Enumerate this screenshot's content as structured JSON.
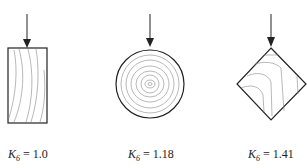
{
  "figures": [
    {
      "shape": "rectangle",
      "symbol": "K",
      "subscript": "6",
      "equals": "=",
      "value": "1.0"
    },
    {
      "shape": "circle",
      "symbol": "K",
      "subscript": "6",
      "equals": "=",
      "value": "1.18"
    },
    {
      "shape": "diamond",
      "symbol": "K",
      "subscript": "6",
      "equals": "=",
      "value": "1.41"
    }
  ],
  "colors": {
    "stroke": "#222222",
    "grain": "#777777"
  }
}
